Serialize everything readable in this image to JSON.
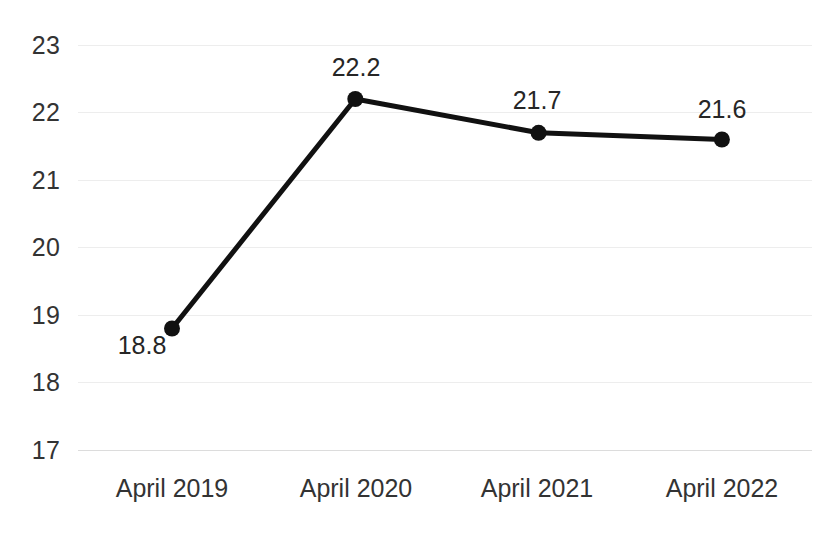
{
  "chart_data": {
    "type": "line",
    "title": "",
    "subtitle": "",
    "xlabel": "",
    "ylabel": "",
    "categories": [
      "April 2019",
      "April 2020",
      "April 2021",
      "April 2022"
    ],
    "values": [
      18.8,
      22.2,
      21.7,
      21.6
    ],
    "point_labels": [
      "18.8",
      "22.2",
      "21.7",
      "21.6"
    ],
    "series": [
      {
        "name": "",
        "values": [
          18.8,
          22.2,
          21.7,
          21.6
        ]
      }
    ],
    "ylim": [
      17,
      23
    ],
    "yticks": [
      23,
      22,
      21,
      20,
      19,
      18,
      17
    ],
    "ytick_labels": [
      "23",
      "22",
      "21",
      "20",
      "19",
      "18",
      "17"
    ],
    "ytick_step": 1,
    "grid": true,
    "grid_axis": "y",
    "legend": false,
    "legend_position": "none",
    "colors": {
      "line": "#111111",
      "marker": "#111111",
      "grid": "#ededed",
      "baseline": "#dcdcdc",
      "axis_text": "#333333",
      "label_text": "#262626",
      "background": "#ffffff"
    },
    "marker": {
      "shape": "circle",
      "radius": 8
    },
    "line_width": 5,
    "label_placement": [
      "below-left",
      "above",
      "above",
      "above"
    ]
  }
}
